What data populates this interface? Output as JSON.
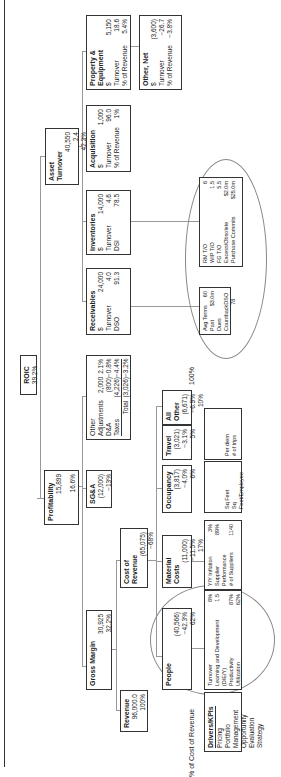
{
  "roic": {
    "title": "ROIC",
    "value": "39.2%"
  },
  "profitability": {
    "title": "Profitability",
    "value": "15,899",
    "pct": "16.6%"
  },
  "asset_turnover": {
    "title": "Asset Turnover",
    "value": "40,550",
    "ratio": "2.4",
    "pct": "42.2%"
  },
  "gross_margin": {
    "title": "Gross Margin",
    "value": "30,925",
    "pct": "32.2%"
  },
  "sga": {
    "title": "SG&A",
    "value": "(12,000)",
    "pct": "−13%"
  },
  "other": {
    "title": "Other",
    "rows": [
      {
        "label": "Adjustments",
        "value": "2,000",
        "pct": "2.1%"
      },
      {
        "label": "D&A",
        "value": "(800)",
        "pct": "−0.8%"
      },
      {
        "label": "Taxes",
        "value": "(4,226)",
        "pct": "−4.4%"
      },
      {
        "label": "Total",
        "value": "(3,026)",
        "pct": "−3.2%"
      }
    ]
  },
  "receivables": {
    "title": "Receivables",
    "rows": [
      {
        "label": "$",
        "value": "24,000"
      },
      {
        "label": "Turnover",
        "value": "4.0"
      },
      {
        "label": "DSO",
        "value": "91.3"
      }
    ]
  },
  "inventories": {
    "title": "Inventories",
    "rows": [
      {
        "label": "$",
        "value": "14,000"
      },
      {
        "label": "Turnover",
        "value": "4.6"
      },
      {
        "label": "DSI",
        "value": "78.5"
      }
    ]
  },
  "acquisition": {
    "title": "Acquisition",
    "rows": [
      {
        "label": "$",
        "value": "1,000"
      },
      {
        "label": "Turnover",
        "value": "96.0"
      },
      {
        "label": "% of Revenue",
        "value": "1%"
      }
    ]
  },
  "property_equipment": {
    "title": "Property & Equipment",
    "rows": [
      {
        "label": "$",
        "value": "5,150"
      },
      {
        "label": "Turnover",
        "value": "18.6"
      },
      {
        "label": "% of Revenue",
        "value": "5.4%"
      }
    ]
  },
  "other_net": {
    "title": "Other, Net",
    "rows": [
      {
        "label": "$",
        "value": "(3,600)"
      },
      {
        "label": "Turnover",
        "value": "−26.7"
      },
      {
        "label": "% of Revenue",
        "value": "−3.8%"
      }
    ]
  },
  "revenue": {
    "title": "Revenue",
    "value": "96,000.0",
    "pct": "100%"
  },
  "cost_of_revenue": {
    "title": "Cost of Revenue",
    "value": "(65,075)",
    "pct": "−68%"
  },
  "people": {
    "title": "People",
    "value": "(40,566)",
    "pct": "−42.3%",
    "share": "62%"
  },
  "material_costs": {
    "title": "Material Costs",
    "value": "(11,000)",
    "pct": "−11.5%",
    "share": "17%"
  },
  "occupancy": {
    "title": "Occupancy",
    "value": "(3,817)",
    "pct": "−4.0%",
    "share": "6%"
  },
  "travel": {
    "title": "Travel",
    "value": "(3,021)",
    "pct": "−3.1%",
    "share": "5%"
  },
  "all_other": {
    "title": "All Other",
    "value": "(6,671)",
    "pct": "−6.9%",
    "share": "10%"
  },
  "labels": {
    "pct_cost_of_revenue": "% of Cost of Revenue",
    "hundred_pct": "100%"
  },
  "drivers": {
    "title": "Drivers/KPIs",
    "items": [
      "Pricing",
      "Portfolio Management",
      "Opportunity Evaluation",
      "Strategy"
    ]
  },
  "kpi_people": {
    "rows": [
      {
        "label": "Turnover",
        "value": "8%"
      },
      {
        "label": "Learning and Development (D/E/Y)",
        "value": "1.5"
      },
      {
        "label": "Productivity",
        "value": "87%"
      },
      {
        "label": "Utilization",
        "value": "62%"
      }
    ]
  },
  "kpi_material": {
    "rows": [
      {
        "label": "Y/Y Inflation",
        "value": "3%"
      },
      {
        "label": "Supplier Performance",
        "value": "89%"
      },
      {
        "label": "# of Suppliers",
        "value": "1140"
      }
    ]
  },
  "kpi_occupancy": {
    "rows": [
      {
        "label": "Sq Feet",
        "value": ""
      },
      {
        "label": "Sq Feet/Employee",
        "value": ""
      }
    ]
  },
  "kpi_travel": {
    "rows": [
      {
        "label": "Per diem",
        "value": ""
      },
      {
        "label": "# of trips",
        "value": ""
      }
    ]
  },
  "kpi_receivables": {
    "rows": [
      {
        "label": "Avg Terms",
        "value": "60"
      },
      {
        "label": "Past Dues",
        "value": "$3.0m"
      },
      {
        "label": "Countback",
        "value": "DSO 78"
      }
    ]
  },
  "kpi_inventories": {
    "rows": [
      {
        "label": "RM T/O",
        "value": "6"
      },
      {
        "label": "WIP T/O",
        "value": "1.5"
      },
      {
        "label": "FG T/O",
        "value": "5.5"
      },
      {
        "label": "Excess/Obsolete",
        "value": "$2.0m"
      },
      {
        "label": "Purchase Commits",
        "value": "$25.0m"
      }
    ]
  }
}
